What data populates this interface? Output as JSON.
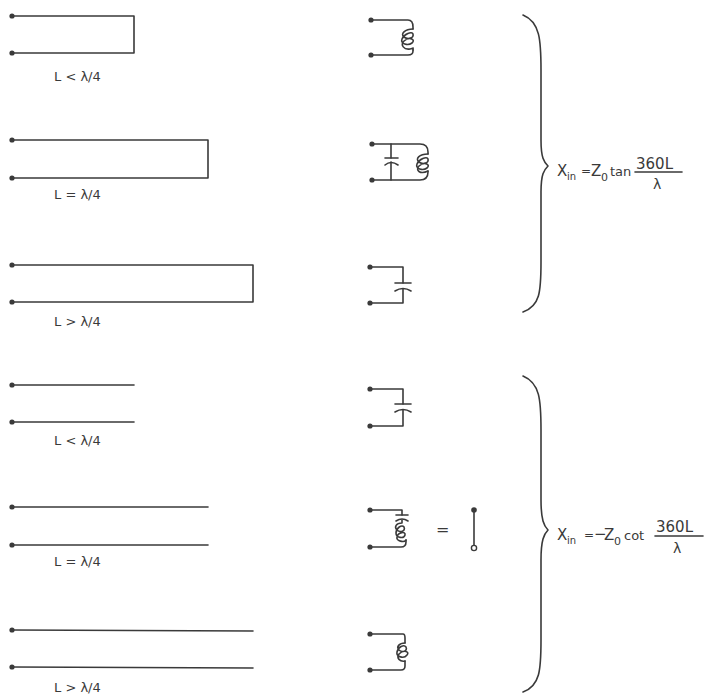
{
  "figure": {
    "colors": {
      "ink": "#3a3a3a",
      "background": "#ffffff"
    }
  },
  "groups": [
    {
      "id": "shorted",
      "termination": "short-circuited",
      "formula": {
        "lhs": "X",
        "lhs_sub": "in",
        "eq": "=",
        "sign": "",
        "z": "Z",
        "z_sub": "0",
        "func": "tan",
        "numerator": "360L",
        "denominator": "λ"
      },
      "rows": [
        {
          "label": "L < λ/4",
          "equivalent": "inductor"
        },
        {
          "label": "L = λ/4",
          "equivalent": "parallel-resonant LC (open circuit)"
        },
        {
          "label": "L > λ/4",
          "equivalent": "capacitor"
        }
      ]
    },
    {
      "id": "open",
      "termination": "open-circuited",
      "formula": {
        "lhs": "X",
        "lhs_sub": "in",
        "eq": "=",
        "sign": "−",
        "z": "Z",
        "z_sub": "0",
        "func": "cot",
        "numerator": "360L",
        "denominator": "λ"
      },
      "rows": [
        {
          "label": "L < λ/4",
          "equivalent": "capacitor"
        },
        {
          "label": "L = λ/4",
          "equivalent": "series-resonant LC (short circuit)",
          "equals": "="
        },
        {
          "label": "L > λ/4",
          "equivalent": "inductor"
        }
      ]
    }
  ]
}
